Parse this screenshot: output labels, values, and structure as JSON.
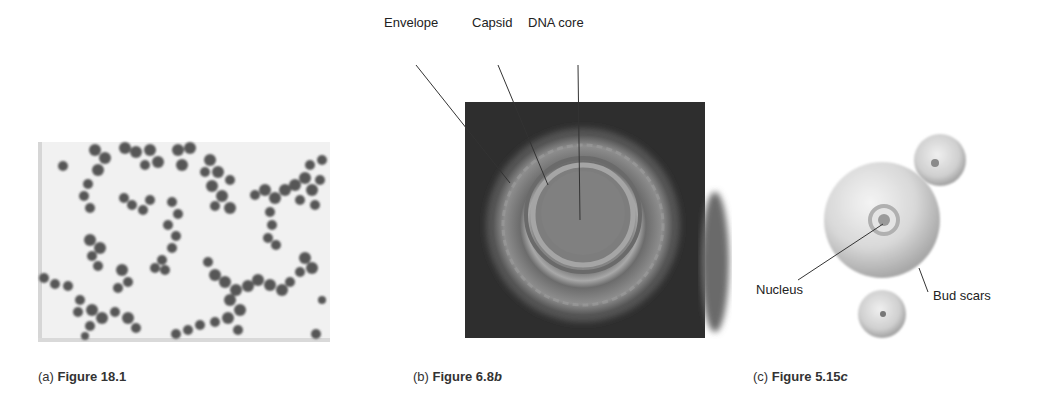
{
  "panels": [
    {
      "id": "a",
      "letter": "(a)",
      "figure_prefix": "Figure 18.1",
      "figure_suffix": "",
      "image": "micrograph-cocci-clusters",
      "labels": []
    },
    {
      "id": "b",
      "letter": "(b)",
      "figure_prefix": "Figure 6.8",
      "figure_suffix": "b",
      "image": "micrograph-virus-particle",
      "labels": [
        "Envelope",
        "Capsid",
        "DNA core"
      ]
    },
    {
      "id": "c",
      "letter": "(c)",
      "figure_prefix": "Figure 5.15",
      "figure_suffix": "c",
      "image": "illustration-budding-yeast",
      "labels": [
        "Nucleus",
        "Bud scars"
      ]
    }
  ],
  "colors": {
    "background": "#ffffff",
    "micrograph_a_bg": "#f2f2f2",
    "micrograph_a_cells": "#5a5a5a",
    "micrograph_b_bg": "#2c2c2c",
    "virus_outer": "#8a8a8a",
    "virus_core": "#7a7a7a",
    "yeast_cell": "#c9c9c9",
    "leader_line": "#333333"
  }
}
